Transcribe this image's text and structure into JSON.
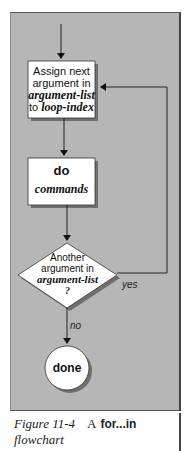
{
  "flowchart": {
    "nodes": {
      "assign": {
        "line1": "Assign next",
        "line2": "argument in",
        "line3": "argument-list",
        "line4_prefix": "to ",
        "line4_var": "loop-index"
      },
      "do": {
        "keyword": "do",
        "body": "commands"
      },
      "decision": {
        "line1": "Another",
        "line2": "argument in",
        "line3": "argument-list",
        "line4": "?"
      },
      "end": {
        "label": "done"
      }
    },
    "edges": {
      "yes_label": "yes",
      "no_label": "no"
    },
    "colors": {
      "panel": "#b6b6b6",
      "node_fill": "#ffffff",
      "line": "#222222",
      "shadow": "#6f6f6f"
    }
  },
  "caption": {
    "figure_number": "Figure 11-4",
    "article": "A",
    "keyword": "for...in",
    "rest": "flowchart"
  }
}
